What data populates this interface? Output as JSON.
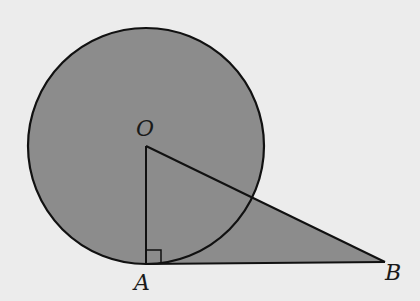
{
  "diagram": {
    "colors": {
      "background": "#ececec",
      "fill": "#8c8c8c",
      "stroke": "#111111"
    },
    "circle": {
      "center_label": "O",
      "cx": 146,
      "cy": 146,
      "r": 118
    },
    "points": {
      "O": {
        "label": "O",
        "x": 146,
        "y": 146
      },
      "A": {
        "label": "A",
        "x": 146,
        "y": 264
      },
      "B": {
        "label": "B",
        "x": 385,
        "y": 262
      }
    },
    "segments": [
      "OA",
      "OB",
      "AB"
    ],
    "right_angle_at": "A"
  }
}
